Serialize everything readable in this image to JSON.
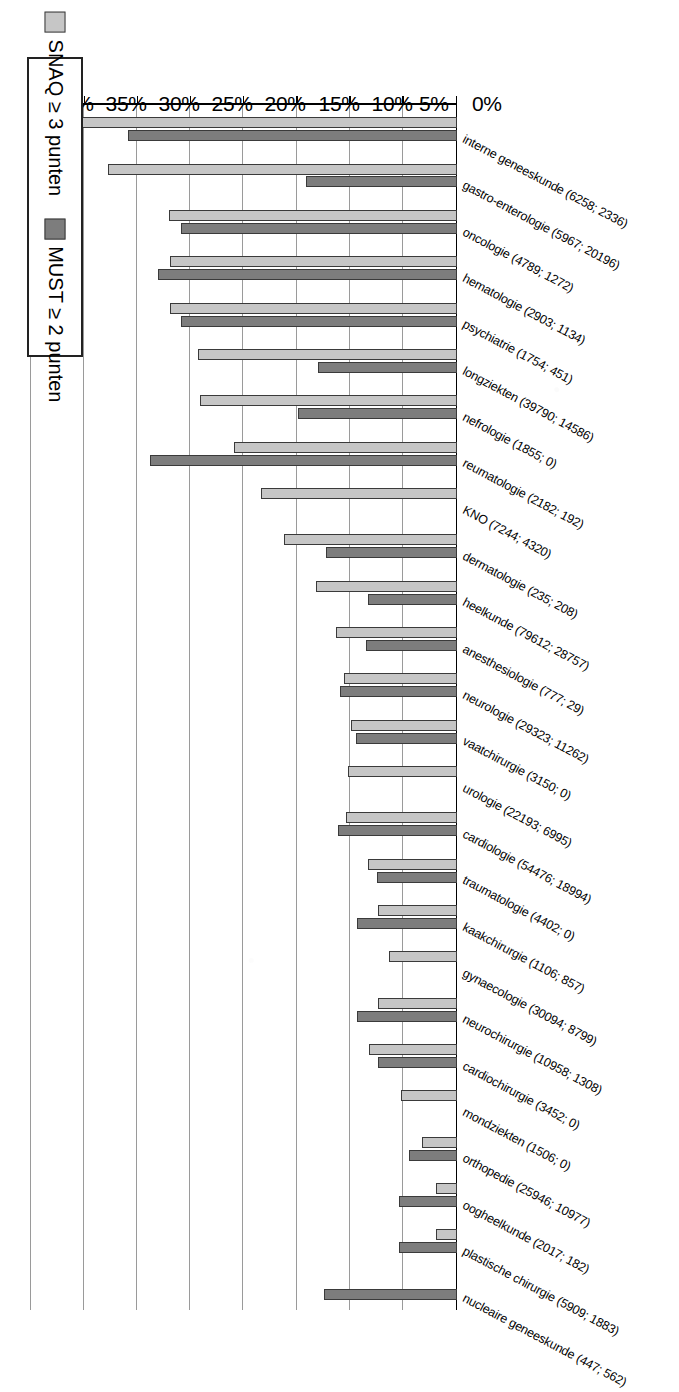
{
  "legend": {
    "items": [
      {
        "label": "SNAQ ≥ 3 punten",
        "color": "#c6c6c6",
        "key": "snaq"
      },
      {
        "label": "MUST ≥ 2 punten",
        "color": "#7d7d7d",
        "key": "must"
      }
    ]
  },
  "axis": {
    "ticks": [
      "0%",
      "5%",
      "10%",
      "15%",
      "20%",
      "25%",
      "30%",
      "35%",
      "40%"
    ]
  },
  "chart_data": {
    "type": "bar",
    "orientation": "horizontal",
    "title": "",
    "xlabel": "",
    "ylabel": "",
    "xlim": [
      0,
      40
    ],
    "xtick_step": 5,
    "grid": true,
    "legend_position": "top-left",
    "value_unit": "%",
    "categories": [
      "interne geneeskunde (6258; 2336)",
      "gastro-enterologie (5967; 20196)",
      "oncologie (4789; 1272)",
      "hematologie (2903; 1134)",
      "psychiatrie (1754; 451)",
      "longziekten (39790; 14586)",
      "nefrologie (1855; 0)",
      "reumatologie (2182; 192)",
      "KNO (7244; 4320)",
      "dermatologie (235; 208)",
      "heelkunde (79612; 28757)",
      "anesthesiologie (777; 29)",
      "neurologie (29323; 11262)",
      "vaatchirurgie (3150; 0)",
      "urologie (22193; 6995)",
      "cardiologie (54476; 18994)",
      "traumatologie (4402; 0)",
      "kaakchirurgie (1106; 857)",
      "gynaecologie (30094; 8799)",
      "neurochirurgie (10958; 1308)",
      "cardiochirurgie (3452; 0)",
      "mondziekten (1506; 0)",
      "orthopedie (25946; 10977)",
      "oogheelkunde (2017; 182)",
      "plastische chirurgie (5909; 1883)",
      "nucleaire geneeskunde (447; 562)"
    ],
    "series": [
      {
        "name": "SNAQ ≥ 3 punten",
        "color": "#c6c6c6",
        "values": [
          37.8,
          32.8,
          27.1,
          27.0,
          27.0,
          24.4,
          24.2,
          21.0,
          18.4,
          16.3,
          13.3,
          11.4,
          10.6,
          10.0,
          10.3,
          10.4,
          8.4,
          7.4,
          6.4,
          7.4,
          8.3,
          5.3,
          3.3,
          2.0,
          2.0,
          0.0
        ]
      },
      {
        "name": "MUST ≥ 2 punten",
        "color": "#7d7d7d",
        "values": [
          31.0,
          14.2,
          26.0,
          28.1,
          26.0,
          13.1,
          15.0,
          28.9,
          0.0,
          12.3,
          8.4,
          8.6,
          11.0,
          9.5,
          0.0,
          11.2,
          7.5,
          9.4,
          0.0,
          9.4,
          7.4,
          0.0,
          4.5,
          5.5,
          5.5,
          12.5
        ]
      }
    ]
  }
}
